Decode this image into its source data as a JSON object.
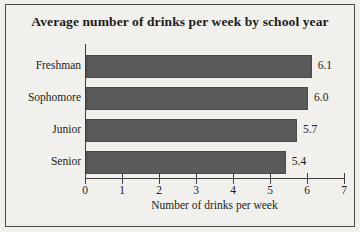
{
  "canvas": {
    "width": 360,
    "height": 232,
    "background_color": "#f1f0ed",
    "border_color": "#4b4b4b"
  },
  "chart_data": {
    "type": "bar",
    "orientation": "horizontal",
    "title": "Average number of drinks per week by school year",
    "subtitle": "",
    "categories": [
      "Freshman",
      "Sophomore",
      "Junior",
      "Senior"
    ],
    "values": [
      6.1,
      6.0,
      5.7,
      5.4
    ],
    "value_labels": [
      "6.1",
      "6.0",
      "5.7",
      "5.4"
    ],
    "xlabel": "Number of drinks per week",
    "ylabel": "",
    "xlim": [
      0,
      7
    ],
    "xticks": [
      0,
      1,
      2,
      3,
      4,
      5,
      6,
      7
    ],
    "xtick_labels": [
      "0",
      "1",
      "2",
      "3",
      "4",
      "5",
      "6",
      "7"
    ],
    "grid": false,
    "legend": false,
    "legend_position": "none",
    "bar_color": "#5a5a5a",
    "bar_edge_color": "#4a4a4a",
    "axis_color": "#3d3d3d"
  }
}
